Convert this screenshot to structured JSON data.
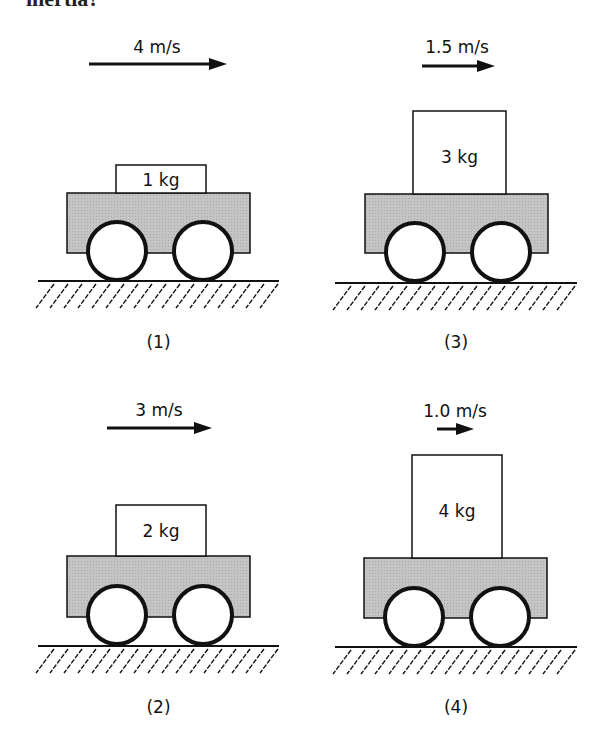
{
  "header": {
    "clipped_text": "inertia?"
  },
  "panels": [
    {
      "id": "1",
      "caption": "(1)",
      "velocity": "4 m/s",
      "mass": "1 kg",
      "arrow": {
        "x1": 89,
        "x2": 227,
        "y": 64
      },
      "vel_label": {
        "x": 157,
        "y": 53
      },
      "block": {
        "x": 116,
        "y": 165,
        "w": 90,
        "h": 28
      },
      "mass_label_y": 186,
      "cart": {
        "x": 67,
        "y": 193,
        "w": 183,
        "h": 60
      },
      "wheels": [
        {
          "cx": 117,
          "cy": 251
        },
        {
          "cx": 203,
          "cy": 251
        }
      ],
      "ground": {
        "x1": 38,
        "x2": 279,
        "y": 281
      },
      "caption_y": 348
    },
    {
      "id": "3",
      "caption": "(3)",
      "velocity": "1.5 m/s",
      "mass": "3 kg",
      "arrow": {
        "x1": 422,
        "x2": 495,
        "y": 66
      },
      "vel_label": {
        "x": 457,
        "y": 53
      },
      "block": {
        "x": 413,
        "y": 111,
        "w": 93,
        "h": 83
      },
      "mass_label_y": 163,
      "cart": {
        "x": 365,
        "y": 194,
        "w": 183,
        "h": 59
      },
      "wheels": [
        {
          "cx": 415,
          "cy": 252
        },
        {
          "cx": 501,
          "cy": 252
        }
      ],
      "ground": {
        "x1": 335,
        "x2": 577,
        "y": 283
      },
      "caption_y": 348
    },
    {
      "id": "2",
      "caption": "(2)",
      "velocity": "3 m/s",
      "mass": "2 kg",
      "arrow": {
        "x1": 107,
        "x2": 212,
        "y": 428
      },
      "vel_label": {
        "x": 159,
        "y": 416
      },
      "block": {
        "x": 116,
        "y": 505,
        "w": 90,
        "h": 51
      },
      "mass_label_y": 537,
      "cart": {
        "x": 67,
        "y": 556,
        "w": 183,
        "h": 61
      },
      "wheels": [
        {
          "cx": 117,
          "cy": 615
        },
        {
          "cx": 203,
          "cy": 615
        }
      ],
      "ground": {
        "x1": 38,
        "x2": 279,
        "y": 646
      },
      "caption_y": 713
    },
    {
      "id": "4",
      "caption": "(4)",
      "velocity": "1.0 m/s",
      "mass": "4 kg",
      "arrow": {
        "x1": 437,
        "x2": 474,
        "y": 429
      },
      "vel_label": {
        "x": 455,
        "y": 417
      },
      "block": {
        "x": 412,
        "y": 455,
        "w": 90,
        "h": 103
      },
      "mass_label_y": 517,
      "cart": {
        "x": 364,
        "y": 558,
        "w": 183,
        "h": 60
      },
      "wheels": [
        {
          "cx": 414,
          "cy": 617
        },
        {
          "cx": 500,
          "cy": 617
        }
      ],
      "ground": {
        "x1": 335,
        "x2": 577,
        "y": 647
      },
      "caption_y": 713
    }
  ],
  "colors": {
    "cart_fill": "#c4c4c4",
    "stroke": "#111111",
    "block_fill": "#ffffff"
  }
}
